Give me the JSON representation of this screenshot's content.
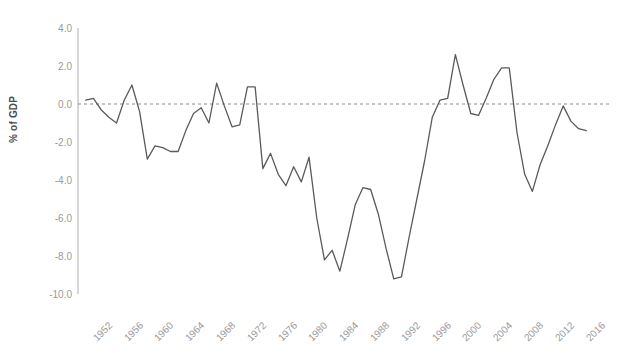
{
  "chart_data": {
    "type": "line",
    "title": "",
    "xlabel": "",
    "ylabel": "% of GDP",
    "xlim": [
      1951,
      2018
    ],
    "ylim": [
      -10.0,
      4.0
    ],
    "grid": false,
    "legend": null,
    "zero_reference_line": true,
    "y_ticks": [
      "4.0",
      "2.0",
      "0.0",
      "-2.0",
      "-4.0",
      "-6.0",
      "-8.0",
      "-10.0"
    ],
    "y_tick_values": [
      4.0,
      2.0,
      0.0,
      -2.0,
      -4.0,
      -6.0,
      -8.0,
      -10.0
    ],
    "x_ticks": [
      "1952",
      "1956",
      "1960",
      "1964",
      "1968",
      "1972",
      "1976",
      "1980",
      "1984",
      "1988",
      "1992",
      "1996",
      "2000",
      "2004",
      "2008",
      "2012",
      "2016"
    ],
    "x_tick_values": [
      1952,
      1956,
      1960,
      1964,
      1968,
      1972,
      1976,
      1980,
      1984,
      1988,
      1992,
      1996,
      2000,
      2004,
      2008,
      2012,
      2016
    ],
    "series_name": "Federal surplus or deficit",
    "x": [
      1952,
      1953,
      1954,
      1955,
      1956,
      1957,
      1958,
      1959,
      1960,
      1961,
      1962,
      1963,
      1964,
      1965,
      1966,
      1967,
      1968,
      1969,
      1970,
      1971,
      1972,
      1973,
      1974,
      1975,
      1976,
      1977,
      1978,
      1979,
      1980,
      1981,
      1982,
      1983,
      1984,
      1985,
      1986,
      1987,
      1988,
      1989,
      1990,
      1991,
      1992,
      1993,
      1994,
      1995,
      1996,
      1997,
      1998,
      1999,
      2000,
      2001,
      2002,
      2003,
      2004,
      2005,
      2006,
      2007,
      2008,
      2009,
      2010,
      2011,
      2012,
      2013,
      2014,
      2015,
      2016,
      2017
    ],
    "values": [
      0.2,
      0.3,
      -0.3,
      -0.7,
      0.7,
      0.7,
      -0.6,
      -2.5,
      0.1,
      -0.6,
      -1.2,
      -0.8,
      -0.9,
      -0.2,
      -0.5,
      -1.1,
      -2.8,
      0.3,
      -0.3,
      -2.1,
      -1.9,
      -1.1,
      -0.4,
      -3.3,
      -4.1,
      -2.6,
      -2.6,
      -1.6,
      -2.6,
      -2.5,
      -3.9,
      -5.9,
      -4.7,
      -5.0,
      -4.9,
      -3.1,
      -3.0,
      -2.7,
      -3.7,
      -4.4,
      -4.5,
      -3.8,
      -2.8,
      -2.2,
      -1.3,
      -0.3,
      0.8,
      1.3,
      2.3,
      1.2,
      -1.4,
      -3.3,
      -3.4,
      -2.4,
      -1.8,
      -1.1,
      -3.1,
      -9.8,
      -8.6,
      -8.4,
      -6.7,
      -4.0,
      -2.8,
      -2.4,
      -3.1,
      -3.4
    ],
    "y_values_plotted": [
      0.2,
      0.3,
      -0.3,
      -0.7,
      0.7,
      0.7,
      -0.6,
      -2.5,
      0.1,
      -0.6,
      -1.2,
      -0.8,
      -0.9,
      -0.2,
      -0.5,
      -1.1,
      -2.8,
      0.3,
      -0.3,
      -2.1,
      -1.9,
      -1.1,
      -0.4,
      -3.3,
      -4.1,
      -2.6,
      -2.6,
      -1.6,
      -2.6,
      -2.5,
      -3.9,
      -5.9,
      -4.7,
      -5.0,
      -4.9,
      -3.1,
      -3.0,
      -2.7,
      -3.7,
      -4.4,
      -4.5,
      -3.8,
      -2.8,
      -2.2,
      -1.3,
      -0.3,
      0.8,
      1.3,
      2.3,
      1.2,
      -1.4,
      -3.3,
      -3.4,
      -2.4,
      -1.8,
      -1.1,
      -3.1,
      -9.8,
      -8.6,
      -8.4,
      -6.7,
      -4.0,
      -2.8,
      -2.4,
      -3.1,
      -3.4
    ],
    "line_color": "#5a5a5a",
    "axis_color": "#b0b0b0",
    "tick_label_color": "#9a9a9a",
    "zero_line_color": "#8a8a8a",
    "series": [
      {
        "name": "Federal surplus or deficit",
        "points": [
          {
            "x": 1952,
            "y": 0.2
          },
          {
            "x": 1953,
            "y": 0.3
          },
          {
            "x": 1954,
            "y": -0.3
          },
          {
            "x": 1955,
            "y": -0.7
          },
          {
            "x": 1956,
            "y": -1.0
          },
          {
            "x": 1957,
            "y": 0.2
          },
          {
            "x": 1958,
            "y": 1.0
          },
          {
            "x": 1959,
            "y": -0.4
          },
          {
            "x": 1960,
            "y": -2.9
          },
          {
            "x": 1961,
            "y": -2.2
          },
          {
            "x": 1962,
            "y": -2.3
          },
          {
            "x": 1963,
            "y": -2.5
          },
          {
            "x": 1964,
            "y": -2.5
          },
          {
            "x": 1965,
            "y": -1.4
          },
          {
            "x": 1966,
            "y": -0.5
          },
          {
            "x": 1967,
            "y": -0.2
          },
          {
            "x": 1968,
            "y": -1.0
          },
          {
            "x": 1969,
            "y": 1.1
          },
          {
            "x": 1970,
            "y": -0.1
          },
          {
            "x": 1971,
            "y": -1.2
          },
          {
            "x": 1972,
            "y": -1.1
          },
          {
            "x": 1973,
            "y": 0.9
          },
          {
            "x": 1974,
            "y": 0.9
          },
          {
            "x": 1975,
            "y": -3.4
          },
          {
            "x": 1976,
            "y": -2.6
          },
          {
            "x": 1977,
            "y": -3.7
          },
          {
            "x": 1978,
            "y": -4.3
          },
          {
            "x": 1979,
            "y": -3.3
          },
          {
            "x": 1980,
            "y": -4.1
          },
          {
            "x": 1981,
            "y": -2.8
          },
          {
            "x": 1982,
            "y": -6.0
          },
          {
            "x": 1983,
            "y": -8.2
          },
          {
            "x": 1984,
            "y": -7.7
          },
          {
            "x": 1985,
            "y": -8.8
          },
          {
            "x": 1986,
            "y": -7.1
          },
          {
            "x": 1987,
            "y": -5.3
          },
          {
            "x": 1988,
            "y": -4.4
          },
          {
            "x": 1989,
            "y": -4.5
          },
          {
            "x": 1990,
            "y": -5.8
          },
          {
            "x": 1991,
            "y": -7.6
          },
          {
            "x": 1992,
            "y": -9.2
          },
          {
            "x": 1993,
            "y": -9.1
          },
          {
            "x": 1994,
            "y": -7.0
          },
          {
            "x": 1995,
            "y": -5.0
          },
          {
            "x": 1996,
            "y": -3.0
          },
          {
            "x": 1997,
            "y": -0.7
          },
          {
            "x": 1998,
            "y": 0.2
          },
          {
            "x": 1999,
            "y": 0.3
          },
          {
            "x": 2000,
            "y": 2.6
          },
          {
            "x": 2001,
            "y": 1.0
          },
          {
            "x": 2002,
            "y": -0.5
          },
          {
            "x": 2003,
            "y": -0.6
          },
          {
            "x": 2004,
            "y": 0.3
          },
          {
            "x": 2005,
            "y": 1.3
          },
          {
            "x": 2006,
            "y": 1.9
          },
          {
            "x": 2007,
            "y": 1.9
          },
          {
            "x": 2008,
            "y": -1.5
          },
          {
            "x": 2009,
            "y": -3.7
          },
          {
            "x": 2010,
            "y": -4.6
          },
          {
            "x": 2011,
            "y": -3.2
          },
          {
            "x": 2012,
            "y": -2.2
          },
          {
            "x": 2013,
            "y": -1.1
          },
          {
            "x": 2014,
            "y": -0.1
          },
          {
            "x": 2015,
            "y": -0.9
          },
          {
            "x": 2016,
            "y": -1.3
          },
          {
            "x": 2017,
            "y": -1.4
          }
        ]
      }
    ]
  }
}
